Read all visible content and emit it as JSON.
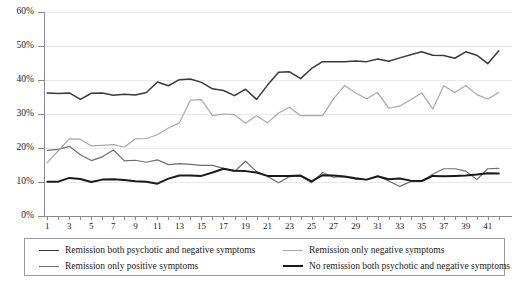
{
  "chart_data": {
    "type": "line",
    "title": "",
    "xlabel": "",
    "ylabel": "",
    "ylim": [
      0,
      60
    ],
    "y_unit": "%",
    "grid": true,
    "legend_position": "bottom",
    "yticks": [
      "0%",
      "10%",
      "20%",
      "30%",
      "40%",
      "50%",
      "60%"
    ],
    "ytick_values": [
      0,
      10,
      20,
      30,
      40,
      50,
      60
    ],
    "x": [
      1,
      2,
      3,
      4,
      5,
      6,
      7,
      8,
      9,
      10,
      11,
      12,
      13,
      14,
      15,
      16,
      17,
      18,
      19,
      20,
      21,
      22,
      23,
      24,
      25,
      26,
      27,
      28,
      29,
      30,
      31,
      32,
      33,
      34,
      35,
      36,
      37,
      38,
      39,
      40,
      41,
      42
    ],
    "xtick_labels": [
      "1",
      "3",
      "5",
      "7",
      "9",
      "11",
      "13",
      "15",
      "17",
      "19",
      "21",
      "23",
      "25",
      "27",
      "29",
      "31",
      "33",
      "35",
      "37",
      "39",
      "41"
    ],
    "xtick_values": [
      1,
      3,
      5,
      7,
      9,
      11,
      13,
      15,
      17,
      19,
      21,
      23,
      25,
      27,
      29,
      31,
      33,
      35,
      37,
      39,
      41
    ],
    "series": [
      {
        "name": "Remission both psychotic and negative symptoms",
        "color": "#3a3a3a",
        "width": 1.5,
        "values": [
          36.2,
          36.0,
          36.2,
          34.3,
          36.1,
          36.2,
          35.5,
          35.8,
          35.6,
          36.3,
          39.4,
          38.3,
          40.1,
          40.3,
          39.3,
          37.4,
          36.9,
          35.4,
          37.3,
          34.3,
          38.5,
          42.3,
          42.4,
          40.4,
          43.4,
          45.4,
          45.4,
          45.4,
          45.6,
          45.4,
          46.2,
          45.5,
          46.5,
          47.4,
          48.3,
          47.3,
          47.2,
          46.4,
          48.3,
          47.3,
          44.8,
          48.6
        ]
      },
      {
        "name": "Remission only positive symptoms",
        "color": "#6f6f6f",
        "width": 1.2,
        "values": [
          19.3,
          19.6,
          20.5,
          18.0,
          16.3,
          17.4,
          19.4,
          16.2,
          16.4,
          15.8,
          16.5,
          15.1,
          15.4,
          15.2,
          14.9,
          14.9,
          14.0,
          13.1,
          16.1,
          13.1,
          11.6,
          9.8,
          11.6,
          11.7,
          9.8,
          12.8,
          11.4,
          11.6,
          10.8,
          10.7,
          11.7,
          10.3,
          8.7,
          10.1,
          10.2,
          12.3,
          13.9,
          13.9,
          13.2,
          10.7,
          13.9,
          14.0
        ]
      },
      {
        "name": "Remission only negative symptoms",
        "color": "#a8a8a8",
        "width": 1.2,
        "values": [
          15.7,
          19.2,
          22.7,
          22.6,
          20.6,
          20.8,
          21.0,
          20.3,
          22.7,
          22.8,
          23.9,
          25.9,
          27.4,
          34.1,
          34.2,
          29.5,
          30.0,
          29.8,
          27.3,
          29.5,
          27.4,
          30.3,
          32.0,
          29.5,
          29.5,
          29.5,
          34.5,
          38.4,
          36.2,
          34.5,
          36.3,
          31.7,
          32.3,
          34.2,
          36.2,
          31.5,
          38.3,
          36.3,
          38.4,
          35.7,
          34.4,
          36.3
        ]
      },
      {
        "name": "No remission both psychotic and negative symptoms",
        "color": "#1a1a1a",
        "width": 2.0,
        "values": [
          10.1,
          10.1,
          11.2,
          10.9,
          10.0,
          10.7,
          10.8,
          10.6,
          10.2,
          10.1,
          9.5,
          11.0,
          11.9,
          11.9,
          11.8,
          12.8,
          13.9,
          13.3,
          13.2,
          12.8,
          11.8,
          11.8,
          11.8,
          11.9,
          10.2,
          12.0,
          11.9,
          11.6,
          11.1,
          10.7,
          11.7,
          10.8,
          11.0,
          10.4,
          10.3,
          11.8,
          11.7,
          11.8,
          11.9,
          12.2,
          12.6,
          12.5
        ]
      }
    ]
  },
  "legend": {
    "items": [
      {
        "label": "Remission both psychotic and negative symptoms",
        "color": "#3a3a3a",
        "width": 1.5
      },
      {
        "label": "Remission only negative symptoms",
        "color": "#a8a8a8",
        "width": 1.2
      },
      {
        "label": "Remission only positive symptoms",
        "color": "#6f6f6f",
        "width": 1.2
      },
      {
        "label": "No remission both psychotic and negative symptoms",
        "color": "#1a1a1a",
        "width": 2.0
      }
    ]
  },
  "caption": ""
}
